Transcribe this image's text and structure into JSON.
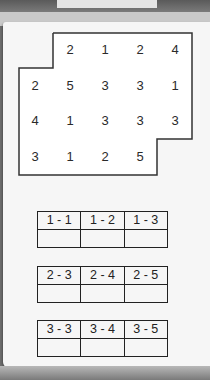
{
  "grid": {
    "rows": [
      [
        "",
        "2",
        "1",
        "2",
        "4"
      ],
      [
        "2",
        "5",
        "3",
        "3",
        "1"
      ],
      [
        "4",
        "1",
        "3",
        "3",
        "3"
      ],
      [
        "3",
        "1",
        "2",
        "5",
        ""
      ]
    ]
  },
  "tables": [
    {
      "headers": [
        "1 - 1",
        "1 - 2",
        "1 - 3"
      ],
      "values": [
        "",
        "",
        ""
      ]
    },
    {
      "headers": [
        "2 - 3",
        "2 - 4",
        "2 - 5"
      ],
      "values": [
        "",
        "",
        ""
      ]
    },
    {
      "headers": [
        "3 - 3",
        "3 - 4",
        "3 - 5"
      ],
      "values": [
        "",
        "",
        ""
      ]
    }
  ],
  "colors": {
    "line": "#333333",
    "text": "#2a2a2a",
    "paper": "#f6f6f6",
    "background": "#6e6e6e"
  }
}
